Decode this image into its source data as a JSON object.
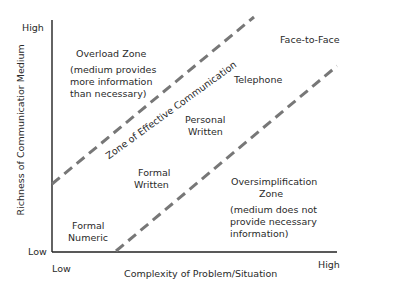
{
  "diagram": {
    "axes": {
      "y_title": "Richness of Communicatior Medium",
      "x_title": "Complexity of Problem/Situation",
      "y_high": "High",
      "y_low": "Low",
      "x_low": "Low",
      "x_high": "High"
    },
    "zones": {
      "overload_title": "Overload Zone",
      "overload_desc": [
        "(medium provides",
        "more information",
        "than necessary)"
      ],
      "effective_label": "Zone of Effective Communication",
      "oversimplification_title": [
        "Oversimplification",
        "Zone"
      ],
      "oversimplification_desc": [
        "(medium does not",
        "provide necessary",
        "information)"
      ]
    },
    "media": {
      "face_to_face": "Face-to-Face",
      "telephone": "Telephone",
      "personal_written": [
        "Personal",
        "Written"
      ],
      "formal_written": [
        "Formal",
        "Written"
      ],
      "formal_numeric": [
        "Formal",
        "Numeric"
      ]
    },
    "colors": {
      "axis": "#222222",
      "dashed_line": "#777777",
      "text": "#2a2a2a"
    }
  }
}
